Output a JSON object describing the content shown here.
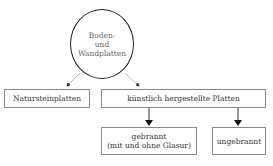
{
  "diagram": {
    "root": {
      "label": "Boden-\nund\nWandplatten"
    },
    "level1": [
      {
        "label": "Natursteinplatten"
      },
      {
        "label": "künstlich hergestellte Platten"
      }
    ],
    "level2": [
      {
        "label": "gebrannt\n(mit und ohne Glasur)"
      },
      {
        "label": "ungebrannt"
      }
    ],
    "edges": [
      {
        "from": "Boden- und Wandplatten",
        "to": "Natursteinplatten"
      },
      {
        "from": "Boden- und Wandplatten",
        "to": "künstlich hergestellte Platten"
      },
      {
        "from": "künstlich hergestellte Platten",
        "to": "gebrannt (mit und ohne Glasur)"
      },
      {
        "from": "künstlich hergestellte Platten",
        "to": "ungebrannt"
      }
    ]
  }
}
